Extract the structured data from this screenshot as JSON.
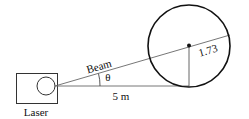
{
  "diagram": {
    "labels": {
      "laser": "Laser",
      "beam": "Beam",
      "angle": "θ",
      "distance": "5 m",
      "radius": "1.73"
    },
    "colors": {
      "stroke": "#111111",
      "thin_line": "#555555",
      "background": "#ffffff"
    }
  }
}
